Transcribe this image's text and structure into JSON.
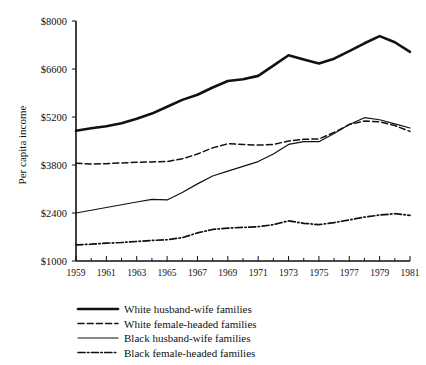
{
  "chart_data": {
    "type": "line",
    "title": "",
    "xlabel": "",
    "ylabel": "Per capita income",
    "xlim": [
      1959,
      1981
    ],
    "ylim": [
      1000,
      8000
    ],
    "grid": false,
    "legend_position": "bottom-left",
    "x": [
      1959,
      1960,
      1961,
      1962,
      1963,
      1964,
      1965,
      1966,
      1967,
      1968,
      1969,
      1970,
      1971,
      1972,
      1973,
      1974,
      1975,
      1976,
      1977,
      1978,
      1979,
      1980,
      1981
    ],
    "xticks": [
      "1959",
      "1961",
      "1963",
      "1965",
      "1967",
      "1969",
      "1971",
      "1973",
      "1975",
      "1977",
      "1979",
      "1981"
    ],
    "yticks": [
      "$1000",
      "$2400",
      "$3800",
      "$5200",
      "$6600",
      "$8000"
    ],
    "ytick_values": [
      1000,
      2400,
      3800,
      5200,
      6600,
      8000
    ],
    "series": [
      {
        "name": "White husband-wife families",
        "style": "solid-thick",
        "values": [
          4800,
          4870,
          4930,
          5020,
          5150,
          5300,
          5500,
          5700,
          5850,
          6060,
          6250,
          6300,
          6400,
          6700,
          7000,
          6880,
          6760,
          6900,
          7120,
          7350,
          7560,
          7380,
          7100
        ]
      },
      {
        "name": "White female-headed families",
        "style": "dashed",
        "values": [
          3850,
          3830,
          3840,
          3860,
          3880,
          3890,
          3900,
          3980,
          4120,
          4300,
          4420,
          4400,
          4380,
          4400,
          4500,
          4550,
          4560,
          4750,
          4980,
          5080,
          5060,
          4950,
          4780
        ]
      },
      {
        "name": "Black husband-wife families",
        "style": "solid-thin",
        "values": [
          2400,
          2480,
          2560,
          2640,
          2720,
          2800,
          2780,
          3000,
          3250,
          3480,
          3620,
          3760,
          3900,
          4120,
          4400,
          4480,
          4480,
          4720,
          4980,
          5180,
          5120,
          5000,
          4880
        ]
      },
      {
        "name": "Black female-headed families",
        "style": "dash-dot",
        "values": [
          1470,
          1490,
          1520,
          1540,
          1570,
          1600,
          1620,
          1680,
          1820,
          1920,
          1960,
          1980,
          2000,
          2060,
          2170,
          2100,
          2060,
          2120,
          2200,
          2280,
          2340,
          2380,
          2330
        ]
      }
    ]
  },
  "legend": {
    "items": [
      {
        "label": "White husband-wife families",
        "style": "solid-thick"
      },
      {
        "label": "White female-headed families",
        "style": "dashed"
      },
      {
        "label": "Black husband-wife families",
        "style": "solid-thin"
      },
      {
        "label": "Black female-headed families",
        "style": "dash-dot"
      }
    ]
  }
}
